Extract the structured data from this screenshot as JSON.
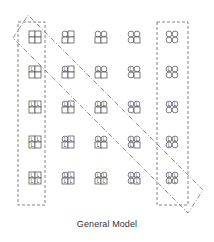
{
  "caption": "General Model",
  "grid": {
    "columns": 5,
    "rows": 5,
    "col_x": [
      35,
      68,
      101,
      134,
      172
    ],
    "row_y": [
      37,
      72,
      107,
      142,
      178
    ],
    "description": "Each cell is a 2x2 arrangement of elements. Column index = number of circles (0-4, filled in order TL,TR,BL,BR). Row index = number of 'L' labels (0-4, in order TL,TR,BL,BR).",
    "cells": [
      [
        {
          "circles": 0,
          "labels": 0
        },
        {
          "circles": 1,
          "labels": 0
        },
        {
          "circles": 2,
          "labels": 0
        },
        {
          "circles": 3,
          "labels": 0
        },
        {
          "circles": 4,
          "labels": 0
        }
      ],
      [
        {
          "circles": 0,
          "labels": 1
        },
        {
          "circles": 1,
          "labels": 1
        },
        {
          "circles": 2,
          "labels": 1
        },
        {
          "circles": 3,
          "labels": 1
        },
        {
          "circles": 4,
          "labels": 1
        }
      ],
      [
        {
          "circles": 0,
          "labels": 2
        },
        {
          "circles": 1,
          "labels": 2
        },
        {
          "circles": 2,
          "labels": 2
        },
        {
          "circles": 3,
          "labels": 2
        },
        {
          "circles": 4,
          "labels": 2
        }
      ],
      [
        {
          "circles": 0,
          "labels": 3
        },
        {
          "circles": 1,
          "labels": 3
        },
        {
          "circles": 2,
          "labels": 3
        },
        {
          "circles": 3,
          "labels": 3
        },
        {
          "circles": 4,
          "labels": 3
        }
      ],
      [
        {
          "circles": 0,
          "labels": 4
        },
        {
          "circles": 1,
          "labels": 4
        },
        {
          "circles": 2,
          "labels": 4
        },
        {
          "circles": 3,
          "labels": 4
        },
        {
          "circles": 4,
          "labels": 4
        }
      ]
    ],
    "label_glyph": "L"
  },
  "highlights": [
    {
      "name": "left-column-box",
      "style": "dashed",
      "x": 18,
      "y": 22,
      "w": 27,
      "h": 183
    },
    {
      "name": "right-column-box",
      "style": "dashed",
      "x": 157,
      "y": 22,
      "w": 31,
      "h": 183
    },
    {
      "name": "diagonal-band",
      "style": "dash-dot"
    }
  ],
  "colors": {
    "stroke": "#444444",
    "dash": "#666666"
  }
}
